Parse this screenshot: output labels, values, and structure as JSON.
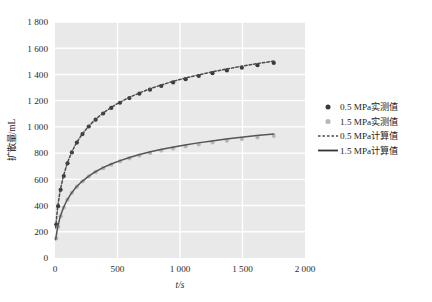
{
  "chart_data": {
    "type": "line",
    "title": "",
    "xlabel": "t/s",
    "ylabel": "扩散量/mL",
    "xlim": [
      0,
      2000
    ],
    "ylim": [
      0,
      1800
    ],
    "xticks": [
      "0",
      "500",
      "1 000",
      "1 500",
      "2 000"
    ],
    "xtick_values": [
      0,
      500,
      1000,
      1500,
      2000
    ],
    "yticks": [
      "0",
      "200",
      "400",
      "600",
      "800",
      "1 000",
      "1 200",
      "1 400",
      "1 600",
      "1 800"
    ],
    "ytick_values": [
      0,
      200,
      400,
      600,
      800,
      1000,
      1200,
      1400,
      1600,
      1800
    ],
    "grid": true,
    "plot_background": "#e9e9e9",
    "grid_color": "#ffffff",
    "legend_position": "right",
    "series": [
      {
        "name": "0.5 MPa实测值",
        "style": "markers",
        "marker": "circle",
        "color": "#3a3a3a",
        "x": [
          10,
          25,
          45,
          70,
          100,
          135,
          175,
          220,
          270,
          325,
          385,
          450,
          520,
          595,
          675,
          760,
          850,
          945,
          1045,
          1150,
          1260,
          1375,
          1495,
          1620,
          1750
        ],
        "y": [
          255,
          395,
          520,
          625,
          722,
          805,
          880,
          945,
          1003,
          1055,
          1102,
          1145,
          1184,
          1220,
          1253,
          1284,
          1312,
          1339,
          1364,
          1388,
          1410,
          1431,
          1451,
          1470,
          1488
        ]
      },
      {
        "name": "1.5 MPa实测值",
        "style": "markers",
        "marker": "circle",
        "color": "#b6b6b6",
        "x": [
          10,
          25,
          45,
          70,
          100,
          135,
          175,
          220,
          270,
          325,
          385,
          450,
          520,
          595,
          675,
          760,
          850,
          945,
          1045,
          1150,
          1260,
          1375,
          1495,
          1620,
          1750
        ],
        "y": [
          150,
          238,
          318,
          385,
          445,
          497,
          544,
          585,
          622,
          655,
          685,
          712,
          737,
          760,
          781,
          801,
          819,
          836,
          852,
          867,
          881,
          895,
          907,
          920,
          931
        ]
      },
      {
        "name": "0.5 MPa计算值",
        "style": "dashed-line",
        "color": "#4a4a4a",
        "x": [
          5,
          20,
          40,
          65,
          95,
          130,
          170,
          215,
          265,
          320,
          380,
          445,
          515,
          590,
          670,
          755,
          845,
          940,
          1040,
          1145,
          1255,
          1370,
          1490,
          1615,
          1750
        ],
        "y": [
          230,
          378,
          508,
          616,
          715,
          800,
          876,
          942,
          1001,
          1054,
          1102,
          1146,
          1186,
          1223,
          1257,
          1289,
          1318,
          1346,
          1372,
          1396,
          1419,
          1441,
          1462,
          1482,
          1502
        ]
      },
      {
        "name": "1.5 MPa计算值",
        "style": "solid-line",
        "color": "#555555",
        "x": [
          5,
          20,
          40,
          65,
          95,
          130,
          170,
          215,
          265,
          320,
          380,
          445,
          515,
          590,
          670,
          755,
          845,
          940,
          1040,
          1145,
          1255,
          1370,
          1490,
          1615,
          1750
        ],
        "y": [
          140,
          228,
          310,
          378,
          440,
          493,
          541,
          583,
          621,
          656,
          687,
          715,
          741,
          765,
          787,
          808,
          827,
          845,
          862,
          878,
          893,
          907,
          921,
          934,
          946
        ]
      }
    ]
  },
  "legend": {
    "items": [
      {
        "label": "0.5 MPa实测值",
        "marker": "dot-dark"
      },
      {
        "label": "1.5 MPa实测值",
        "marker": "dot-light"
      },
      {
        "label": "0.5 MPa计算值",
        "marker": "line-dashed"
      },
      {
        "label": "1.5 MPa计算值",
        "marker": "line-solid"
      }
    ]
  }
}
